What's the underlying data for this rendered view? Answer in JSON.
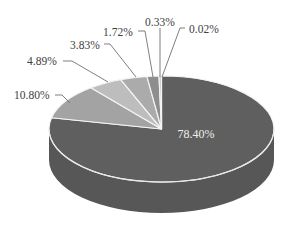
{
  "chart_data": {
    "type": "pie",
    "style": "3d",
    "title": "",
    "categories": [
      "Slice 1",
      "Slice 2",
      "Slice 3",
      "Slice 4",
      "Slice 5",
      "Slice 6",
      "Slice 7"
    ],
    "values": [
      78.4,
      10.8,
      4.89,
      3.83,
      1.72,
      0.33,
      0.02
    ],
    "labels": [
      "78.40%",
      "10.80%",
      "4.89%",
      "3.83%",
      "1.72%",
      "0.33%",
      "0.02%"
    ],
    "colors": [
      "#5f5f5f",
      "#a3a3a3",
      "#bdbdbd",
      "#ababab",
      "#8e8e8e",
      "#b5b5b5",
      "#6a6a6a"
    ],
    "start_angle_deg": -90,
    "direction": "clockwise",
    "legend": "none",
    "label_positions": [
      {
        "x": 196,
        "y": 138,
        "anchor": "middle",
        "inside": true
      },
      {
        "x": 14,
        "y": 99,
        "anchor": "start",
        "leader": [
          [
            55,
            95
          ],
          [
            62,
            95
          ],
          [
            70,
            103
          ]
        ]
      },
      {
        "x": 27,
        "y": 65,
        "anchor": "start",
        "leader": [
          [
            63,
            61
          ],
          [
            72,
            61
          ],
          [
            108,
            82
          ]
        ]
      },
      {
        "x": 70,
        "y": 49,
        "anchor": "start",
        "leader": [
          [
            104,
            44
          ],
          [
            110,
            44
          ],
          [
            136,
            77
          ]
        ]
      },
      {
        "x": 103,
        "y": 36,
        "anchor": "start",
        "leader": [
          [
            138,
            31
          ],
          [
            145,
            31
          ],
          [
            153,
            77
          ]
        ]
      },
      {
        "x": 145,
        "y": 26,
        "anchor": "start",
        "leader": [
          [
            160,
            28
          ],
          [
            160,
            77
          ]
        ]
      },
      {
        "x": 189,
        "y": 33,
        "anchor": "start",
        "leader": [
          [
            185,
            28
          ],
          [
            180,
            28
          ],
          [
            162,
            77
          ]
        ]
      }
    ]
  }
}
